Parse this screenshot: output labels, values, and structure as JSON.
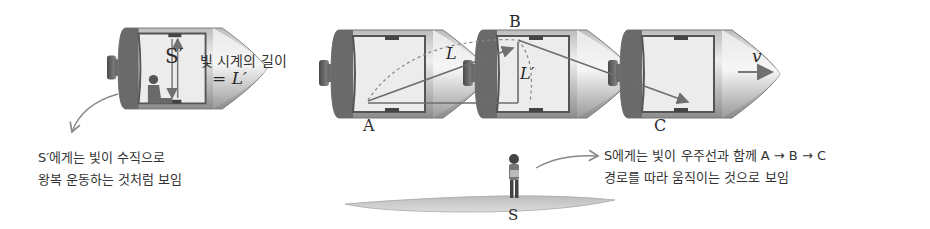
{
  "figure": {
    "colors": {
      "hull_dark": "#5a5a5a",
      "hull_mid": "#9a9a9a",
      "hull_light": "#d8d8d8",
      "cabin": "#ececec",
      "light_path": "#707070",
      "ground": "#c8c8c8",
      "text": "#333333"
    }
  },
  "left_ship": {
    "observer_label": "S′",
    "clock_length_label": "빛 시계의 길이",
    "clock_length_value": "= L′",
    "caption_lines": [
      "S′에게는 빛이 수직으로",
      "왕복 운동하는 것처럼 보임"
    ]
  },
  "moving_ships": {
    "points": {
      "a": "A",
      "b": "B",
      "c": "C"
    },
    "diagonal_length_label": "L",
    "vertical_length_label": "L′",
    "velocity_label": "v"
  },
  "ground_observer": {
    "label": "S",
    "caption_lines": [
      "S에게는 빛이 우주선과 함께 A → B → C",
      "경로를 따라 움직이는 것으로 보임"
    ]
  }
}
